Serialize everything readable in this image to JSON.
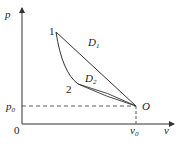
{
  "diagram": {
    "type": "p-v diagram",
    "axes": {
      "y_label": "p",
      "x_label": "v",
      "origin_label": "0",
      "p0_label": "p",
      "p0_sub": "0",
      "v0_label": "v",
      "v0_sub": "0"
    },
    "points": {
      "point1": "1",
      "point2": "2",
      "pointO": "O"
    },
    "regions": {
      "D1": {
        "letter": "D",
        "sub": "1"
      },
      "D2": {
        "letter": "D",
        "sub": "2"
      }
    },
    "colors": {
      "line": "#333333",
      "background": "#ffffff"
    }
  }
}
